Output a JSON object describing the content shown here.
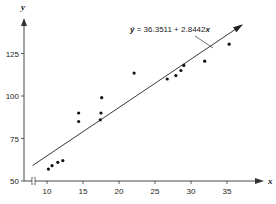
{
  "chart_data": {
    "type": "scatter",
    "title": "",
    "xlabel": "x",
    "ylabel": "y",
    "xlim": [
      8,
      38
    ],
    "ylim": [
      50,
      145
    ],
    "x_ticks": [
      10,
      15,
      20,
      25,
      30,
      35
    ],
    "y_ticks": [
      50,
      75,
      100,
      125
    ],
    "x_tick_labels": [
      "10",
      "15",
      "20",
      "25",
      "30",
      "35"
    ],
    "y_tick_labels": [
      "50",
      "75",
      "100",
      "125"
    ],
    "axis_break": "x-axis near origin",
    "grid": false,
    "points": [
      {
        "x": 10.2,
        "y": 57
      },
      {
        "x": 10.7,
        "y": 59
      },
      {
        "x": 11.5,
        "y": 61
      },
      {
        "x": 12.2,
        "y": 62
      },
      {
        "x": 14.4,
        "y": 85
      },
      {
        "x": 14.4,
        "y": 90
      },
      {
        "x": 17.4,
        "y": 86
      },
      {
        "x": 17.5,
        "y": 90
      },
      {
        "x": 17.6,
        "y": 99
      },
      {
        "x": 22.1,
        "y": 113.5
      },
      {
        "x": 26.7,
        "y": 110
      },
      {
        "x": 27.9,
        "y": 112
      },
      {
        "x": 28.6,
        "y": 115
      },
      {
        "x": 29.0,
        "y": 118
      },
      {
        "x": 31.9,
        "y": 120.5
      },
      {
        "x": 35.3,
        "y": 130.5
      }
    ],
    "regression": {
      "intercept": 36.3511,
      "slope": 2.8442,
      "x_start": 8,
      "x_end": 37,
      "label": "ŷ = 36.3511 + 2.8442x"
    }
  }
}
